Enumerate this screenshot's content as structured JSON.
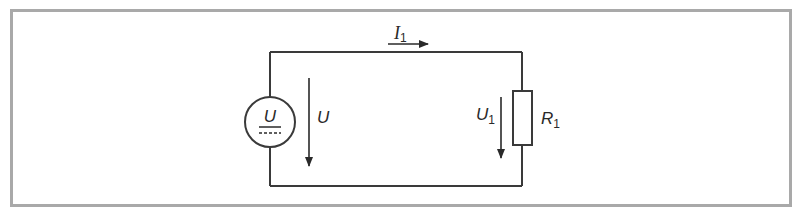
{
  "figure": {
    "type": "circuit-diagram",
    "frame_color": "#a9a9a9",
    "line_color": "#3a3a3a",
    "background": "#ffffff"
  },
  "components": {
    "source": {
      "symbol_label": "U",
      "kind": "DC voltage source"
    },
    "resistor": {
      "label": "R",
      "subscript": "1"
    }
  },
  "annotations": {
    "current": {
      "label": "I",
      "subscript": "1",
      "direction": "right"
    },
    "source_voltage": {
      "label": "U",
      "direction": "down"
    },
    "resistor_voltage": {
      "label": "U",
      "subscript": "1",
      "direction": "down"
    }
  }
}
